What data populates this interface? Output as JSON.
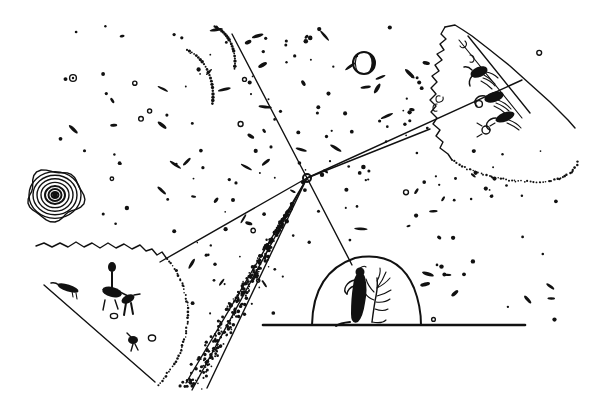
{
  "artwork": {
    "title": "Starfield with Converging Rays",
    "medium": "pen-and-ink line drawing",
    "background_color": "#ffffff",
    "ink_color": "#111111",
    "canvas": {
      "width": 600,
      "height": 399
    }
  },
  "scene": {
    "description": "A dense stippled starfield crossed by long straight rays that converge on a single small open circle. Three land masses (an upper-right irregular mound with winged figures, a lower-left jagged slope with small figures, and a lower-centre dome with a seated figure and a bare tree) sit around a ruled horizon line.",
    "convergence_node": {
      "label": "convergence-node",
      "x": 307,
      "y": 178,
      "radius": 4
    }
  },
  "celestial": {
    "spiral": {
      "label": "spiral-galaxy",
      "cx": 55,
      "cy": 195,
      "rings": [
        26,
        22,
        18,
        14,
        10,
        6.5,
        3.5,
        1.6
      ]
    },
    "moon": {
      "label": "crescent-moon",
      "cx": 364,
      "cy": 63,
      "r": 11
    },
    "small_ring": {
      "label": "small-ring-star",
      "cx": 73,
      "cy": 78,
      "r": 3.4
    }
  },
  "rays": [
    {
      "name": "ray-top-left",
      "x1": 232,
      "y1": 34,
      "x2": 307,
      "y2": 178
    },
    {
      "name": "ray-bottom-right",
      "x1": 307,
      "y1": 178,
      "x2": 207,
      "y2": 388
    },
    {
      "name": "ray-bottom-left-a",
      "x1": 307,
      "y1": 178,
      "x2": 186,
      "y2": 383
    },
    {
      "name": "ray-upper-right",
      "x1": 307,
      "y1": 178,
      "x2": 522,
      "y2": 80
    },
    {
      "name": "ray-east",
      "x1": 307,
      "y1": 178,
      "x2": 430,
      "y2": 129
    },
    {
      "name": "ray-down-to-dome",
      "x1": 307,
      "y1": 178,
      "x2": 352,
      "y2": 265
    },
    {
      "name": "cone-edge-upper",
      "x1": 307,
      "y1": 178,
      "x2": 160,
      "y2": 262
    },
    {
      "name": "cone-edge-lower",
      "x1": 307,
      "y1": 178,
      "x2": 192,
      "y2": 390
    }
  ],
  "horizon": {
    "name": "horizon-line",
    "x1": 263,
    "y1": 325,
    "x2": 525,
    "y2": 325
  },
  "landforms": [
    {
      "name": "upper-right-mound",
      "label": "irregular mound with winged figures",
      "anchor": {
        "x": 470,
        "y": 95
      }
    },
    {
      "name": "lower-left-slope",
      "label": "jagged hillside with small figures",
      "anchor": {
        "x": 110,
        "y": 300
      }
    },
    {
      "name": "lower-centre-dome",
      "label": "dome with seated figure and bare tree",
      "anchor": {
        "x": 365,
        "y": 295
      }
    }
  ],
  "figures": [
    {
      "name": "winged-figure-1",
      "group": "upper-right-mound",
      "x": 478,
      "y": 76
    },
    {
      "name": "winged-figure-2",
      "group": "upper-right-mound",
      "x": 492,
      "y": 97
    },
    {
      "name": "winged-figure-3",
      "group": "upper-right-mound",
      "x": 500,
      "y": 118
    },
    {
      "name": "bird-figure",
      "group": "lower-left-slope",
      "x": 68,
      "y": 285
    },
    {
      "name": "standing-figure-raised-arm",
      "group": "lower-left-slope",
      "x": 113,
      "y": 283
    },
    {
      "name": "crouching-figure",
      "group": "lower-left-slope",
      "x": 126,
      "y": 296
    },
    {
      "name": "small-figure",
      "group": "lower-left-slope",
      "x": 133,
      "y": 338
    },
    {
      "name": "seated-figure",
      "group": "lower-centre-dome",
      "x": 360,
      "y": 292
    },
    {
      "name": "bare-tree",
      "group": "lower-centre-dome",
      "x": 377,
      "y": 290
    }
  ],
  "starfield": {
    "label": "stippled starfield",
    "dot_count_approx": 430,
    "arc_clusters": [
      {
        "name": "dot-arc-upper-left",
        "cx": 175,
        "cy": 95,
        "r": 38
      },
      {
        "name": "dot-arc-upper-mid",
        "cx": 205,
        "cy": 62,
        "r": 30
      }
    ]
  },
  "beam": {
    "name": "stippled-beam",
    "label": "narrow stippled cone descending left from the convergence node",
    "from": {
      "x": 307,
      "y": 178
    },
    "to": {
      "x": 190,
      "y": 388
    }
  }
}
